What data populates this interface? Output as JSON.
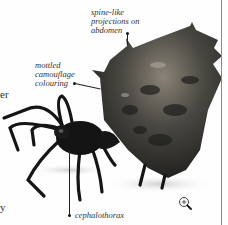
{
  "page": {
    "left_margin_fragments": [
      {
        "text": "er"
      },
      {
        "text": "y"
      }
    ]
  },
  "figure": {
    "labels": [
      {
        "id": "spines",
        "text": "spine-like\nprojections on\nabdomen"
      },
      {
        "id": "colouring",
        "text": "mottled\ncamouflage\ncolouring"
      },
      {
        "id": "cephalothorax",
        "text": "cephalothorax"
      }
    ],
    "zoom_icon": "magnifier-plus-icon"
  },
  "colors": {
    "divider": "#8a8a8a",
    "text": "#333333",
    "spider_dark": "#141414",
    "abdomen": "#3a3a36",
    "abdomen_highlight": "#8a8478"
  }
}
